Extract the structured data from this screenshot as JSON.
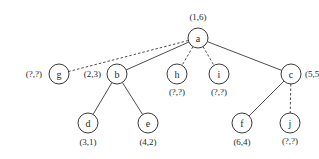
{
  "diagram": {
    "type": "tree",
    "nodes": [
      {
        "id": "a",
        "label": "a",
        "annotation": "(1,6)",
        "x": 198,
        "y": 38,
        "ann_x": 198,
        "ann_y": 17,
        "ann_anchor": "middle"
      },
      {
        "id": "g",
        "label": "g",
        "annotation": "(?,?)",
        "x": 59,
        "y": 74,
        "ann_x": 42,
        "ann_y": 74,
        "ann_anchor": "end"
      },
      {
        "id": "b",
        "label": "b",
        "annotation": "(2,3)",
        "x": 117,
        "y": 74,
        "ann_x": 101,
        "ann_y": 74,
        "ann_anchor": "end"
      },
      {
        "id": "h",
        "label": "h",
        "annotation": "(?,?)",
        "x": 177,
        "y": 74,
        "ann_x": 177,
        "ann_y": 92,
        "ann_anchor": "middle"
      },
      {
        "id": "i",
        "label": "i",
        "annotation": "(?,?)",
        "x": 219,
        "y": 74,
        "ann_x": 219,
        "ann_y": 92,
        "ann_anchor": "middle"
      },
      {
        "id": "c",
        "label": "c",
        "annotation": "(5,5)",
        "x": 291,
        "y": 74,
        "ann_x": 305,
        "ann_y": 74,
        "ann_anchor": "start"
      },
      {
        "id": "d",
        "label": "d",
        "annotation": "(3,1)",
        "x": 88,
        "y": 123,
        "ann_x": 88,
        "ann_y": 142,
        "ann_anchor": "middle"
      },
      {
        "id": "e",
        "label": "e",
        "annotation": "(4,2)",
        "x": 148,
        "y": 123,
        "ann_x": 148,
        "ann_y": 142,
        "ann_anchor": "middle"
      },
      {
        "id": "f",
        "label": "f",
        "annotation": "(6,4)",
        "x": 242,
        "y": 123,
        "ann_x": 242,
        "ann_y": 142,
        "ann_anchor": "middle"
      },
      {
        "id": "j",
        "label": "j",
        "annotation": "(?,?)",
        "x": 290,
        "y": 123,
        "ann_x": 290,
        "ann_y": 141,
        "ann_anchor": "middle"
      }
    ],
    "edges": [
      {
        "from": "a",
        "to": "g",
        "style": "dashed"
      },
      {
        "from": "a",
        "to": "b",
        "style": "solid"
      },
      {
        "from": "a",
        "to": "h",
        "style": "dashed"
      },
      {
        "from": "a",
        "to": "i",
        "style": "dashed"
      },
      {
        "from": "a",
        "to": "c",
        "style": "solid"
      },
      {
        "from": "b",
        "to": "d",
        "style": "solid"
      },
      {
        "from": "b",
        "to": "e",
        "style": "solid"
      },
      {
        "from": "c",
        "to": "f",
        "style": "solid"
      },
      {
        "from": "c",
        "to": "j",
        "style": "dashed"
      }
    ],
    "node_radius": 10,
    "colors": {
      "stroke": "#3a3a3a",
      "text": "#2a2a2a",
      "background": "#ffffff"
    }
  }
}
